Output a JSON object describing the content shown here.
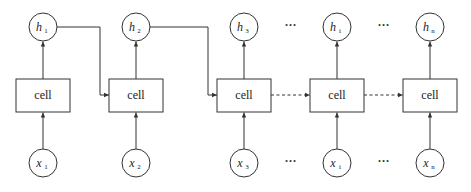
{
  "diagram": {
    "title": "",
    "type": "unrolled-rnn",
    "steps": [
      {
        "hidden": {
          "symbol": "h",
          "sub": "1"
        },
        "cell": "cell",
        "input": {
          "symbol": "x",
          "sub": "1"
        },
        "next_edge": "solid"
      },
      {
        "hidden": {
          "symbol": "h",
          "sub": "2"
        },
        "cell": "cell",
        "input": {
          "symbol": "x",
          "sub": "2"
        },
        "next_edge": "solid"
      },
      {
        "hidden": {
          "symbol": "h",
          "sub": "3"
        },
        "cell": "cell",
        "input": {
          "symbol": "x",
          "sub": "3"
        },
        "next_edge": "dashed"
      },
      {
        "hidden": {
          "symbol": "h",
          "sub": "i"
        },
        "cell": "cell",
        "input": {
          "symbol": "x",
          "sub": "i"
        },
        "next_edge": "dashed"
      },
      {
        "hidden": {
          "symbol": "h",
          "sub": "n"
        },
        "cell": "cell",
        "input": {
          "symbol": "x",
          "sub": "n"
        },
        "next_edge": null
      }
    ],
    "ellipsis": "···",
    "ellipsis_after_steps": [
      3,
      4
    ],
    "stroke_color": "#333333"
  }
}
